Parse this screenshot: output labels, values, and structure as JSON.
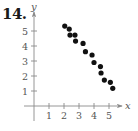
{
  "problem": {
    "number": "14."
  },
  "chart_data": {
    "type": "scatter",
    "title": "",
    "xlabel": "x",
    "ylabel": "y",
    "xlim": [
      0,
      5.8
    ],
    "ylim": [
      0,
      5.8
    ],
    "x_ticks": [
      "1",
      "2",
      "3",
      "4",
      "5"
    ],
    "y_ticks": [
      "1",
      "2",
      "3",
      "4",
      "5"
    ],
    "grid": false,
    "legend": null,
    "series": [
      {
        "name": "data",
        "color": "#111111",
        "points": [
          [
            2.05,
            5.33
          ],
          [
            2.35,
            5.13
          ],
          [
            2.4,
            4.73
          ],
          [
            2.73,
            4.73
          ],
          [
            2.77,
            4.33
          ],
          [
            3.27,
            4.17
          ],
          [
            3.43,
            3.62
          ],
          [
            3.87,
            3.4
          ],
          [
            4.0,
            2.9
          ],
          [
            4.43,
            2.63
          ],
          [
            4.47,
            2.2
          ],
          [
            4.69,
            1.73
          ],
          [
            5.09,
            1.58
          ],
          [
            5.25,
            1.18
          ]
        ]
      }
    ]
  }
}
